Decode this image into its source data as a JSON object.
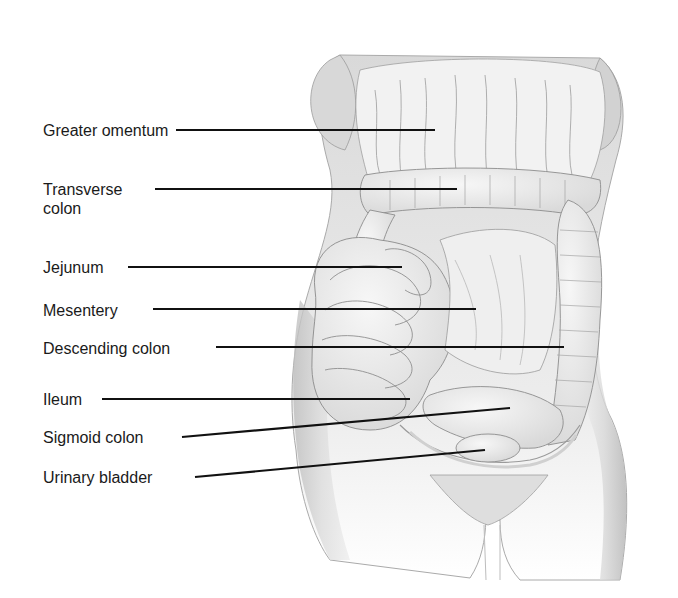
{
  "figure": {
    "colors": {
      "background": "#ffffff",
      "label_text": "#1a1a1a",
      "leader_line": "#111111",
      "skin_shade": "#cfcfcf",
      "organ_fill": "#ececec",
      "organ_outline": "#8a8a8a"
    }
  },
  "labels": [
    {
      "id": "greater-omentum",
      "text": "Greater omentum",
      "x": 43,
      "y": 121,
      "line": {
        "x1": 176,
        "y1": 130,
        "x2": 435,
        "y2": 130
      }
    },
    {
      "id": "transverse-colon",
      "text": "Transverse",
      "text2": "colon",
      "x": 43,
      "y": 180,
      "line": {
        "x1": 155,
        "y1": 189,
        "x2": 457,
        "y2": 189
      }
    },
    {
      "id": "jejunum",
      "text": "Jejunum",
      "x": 43,
      "y": 258,
      "line": {
        "x1": 128,
        "y1": 267,
        "x2": 402,
        "y2": 267
      }
    },
    {
      "id": "mesentery",
      "text": "Mesentery",
      "x": 43,
      "y": 301,
      "line": {
        "x1": 153,
        "y1": 309,
        "x2": 476,
        "y2": 309
      }
    },
    {
      "id": "descending-colon",
      "text": "Descending colon",
      "x": 43,
      "y": 339,
      "line": {
        "x1": 216,
        "y1": 347,
        "x2": 564,
        "y2": 347
      }
    },
    {
      "id": "ileum",
      "text": "Ileum",
      "x": 43,
      "y": 390,
      "line": {
        "x1": 102,
        "y1": 399,
        "x2": 410,
        "y2": 399
      }
    },
    {
      "id": "sigmoid-colon",
      "text": "Sigmoid colon",
      "x": 43,
      "y": 428,
      "line": {
        "x1": 182,
        "y1": 437,
        "x2": 510,
        "y2": 408
      }
    },
    {
      "id": "urinary-bladder",
      "text": "Urinary bladder",
      "x": 43,
      "y": 468,
      "line": {
        "x1": 195,
        "y1": 477,
        "x2": 485,
        "y2": 450
      }
    }
  ]
}
